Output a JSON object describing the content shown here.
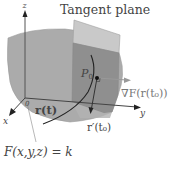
{
  "diagram": {
    "title": "Tangent plane",
    "labels": {
      "z_axis": "z",
      "x_axis": "x",
      "y_axis": "y",
      "origin": "0",
      "point": "P",
      "point_sub": "0",
      "curve": "r(t)",
      "gradient": "∇F(r(t₀))",
      "tangent_vector": "r′(t₀)",
      "surface_equation": "F(x,y,z) = k"
    },
    "colors": {
      "surface": "#a9a9a9",
      "surface_edge": "#9a9a9a",
      "plane": "#8f8f8f",
      "plane_light": "#c8c8c8",
      "axis": "#555555",
      "curve": "#222222",
      "gradient_arrow": "#9a9a9a",
      "text": "#444444"
    }
  }
}
